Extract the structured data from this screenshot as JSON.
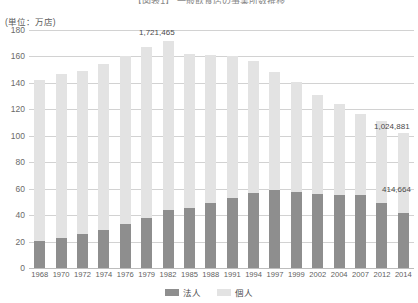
{
  "chart_data": {
    "type": "bar",
    "stacked": true,
    "title": "【図表1】 一般飲食店の事業所数推移",
    "unit_label": "(単位：万店)",
    "xlabel": "",
    "ylabel": "",
    "ylim": [
      0,
      180
    ],
    "ytick_step": 20,
    "yticks": [
      "180",
      "160",
      "140",
      "120",
      "100",
      "80",
      "60",
      "40",
      "20",
      "0"
    ],
    "grid": true,
    "legend_position": "bottom-center",
    "categories": [
      "1968",
      "1970",
      "1972",
      "1974",
      "1976",
      "1979",
      "1982",
      "1985",
      "1988",
      "1991",
      "1994",
      "1997",
      "1999",
      "2002",
      "2004",
      "2007",
      "2012",
      "2014"
    ],
    "series": [
      {
        "name": "法人",
        "color": "#8e8e8e",
        "values": [
          20.5,
          23.0,
          25.5,
          29.0,
          33.0,
          38.0,
          43.5,
          45.5,
          49.5,
          53.0,
          56.5,
          59.0,
          57.5,
          56.0,
          55.0,
          55.5,
          49.0,
          41.5
        ]
      },
      {
        "name": "個人",
        "color": "#e3e3e3",
        "values": [
          121.5,
          123.5,
          123.5,
          125.0,
          127.5,
          129.5,
          128.5,
          116.5,
          111.5,
          107.5,
          100.0,
          89.0,
          83.5,
          74.5,
          69.0,
          61.0,
          62.0,
          61.0
        ]
      }
    ],
    "totals": [
      142.0,
      146.5,
      149.0,
      154.0,
      160.5,
      167.5,
      172.1,
      162.0,
      161.0,
      160.5,
      156.5,
      148.0,
      141.0,
      130.5,
      124.0,
      116.5,
      111.0,
      102.5
    ],
    "annotations": [
      {
        "name": "peak-total-1982",
        "text": "1,721,465",
        "category": "1982",
        "series": "total"
      },
      {
        "name": "last-total-2014",
        "text": "1,024,881",
        "category": "2014",
        "series": "total"
      },
      {
        "name": "last-hojin-2014",
        "text": "414,664",
        "category": "2014",
        "series": "法人"
      }
    ]
  },
  "legend": {
    "items": [
      {
        "label": "法人",
        "color": "#8e8e8e"
      },
      {
        "label": "個人",
        "color": "#e3e3e3"
      }
    ]
  },
  "colors": {
    "hojin": "#8e8e8e",
    "kojin": "#e3e3e3",
    "grid": "#d2d2d2",
    "text": "#555555",
    "background": "#ffffff"
  }
}
